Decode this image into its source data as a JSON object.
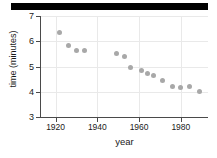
{
  "figure": {
    "header_bar": "black-rule"
  },
  "chart_data": {
    "type": "scatter",
    "title": "",
    "xlabel": "year",
    "ylabel": "time (minutes)",
    "xlim": [
      1913,
      1993
    ],
    "ylim": [
      3,
      7
    ],
    "xticks": [
      1920,
      1940,
      1960,
      1980
    ],
    "xtick_labels": [
      "1920",
      "1940",
      "1960",
      "1980"
    ],
    "yticks": [
      3,
      4,
      5,
      6,
      7
    ],
    "ytick_labels": [
      "3",
      "4",
      "5",
      "6",
      "7"
    ],
    "grid": true,
    "legend": "none",
    "marker_color": "#a8a8a8",
    "x": [
      1922,
      1926,
      1930,
      1934,
      1949,
      1953,
      1956,
      1961,
      1964,
      1967,
      1971,
      1976,
      1980,
      1984,
      1989
    ],
    "y": [
      6.35,
      5.82,
      5.63,
      5.63,
      5.52,
      5.38,
      4.95,
      4.85,
      4.72,
      4.65,
      4.43,
      4.21,
      4.16,
      4.21,
      4.0
    ],
    "points": [
      {
        "year": 1922,
        "time": 6.35
      },
      {
        "year": 1926,
        "time": 5.82
      },
      {
        "year": 1930,
        "time": 5.63
      },
      {
        "year": 1934,
        "time": 5.63
      },
      {
        "year": 1949,
        "time": 5.52
      },
      {
        "year": 1953,
        "time": 5.38
      },
      {
        "year": 1956,
        "time": 4.95
      },
      {
        "year": 1961,
        "time": 4.85
      },
      {
        "year": 1964,
        "time": 4.72
      },
      {
        "year": 1967,
        "time": 4.65
      },
      {
        "year": 1971,
        "time": 4.43
      },
      {
        "year": 1976,
        "time": 4.21
      },
      {
        "year": 1980,
        "time": 4.16
      },
      {
        "year": 1984,
        "time": 4.21
      },
      {
        "year": 1989,
        "time": 4.0
      }
    ]
  }
}
